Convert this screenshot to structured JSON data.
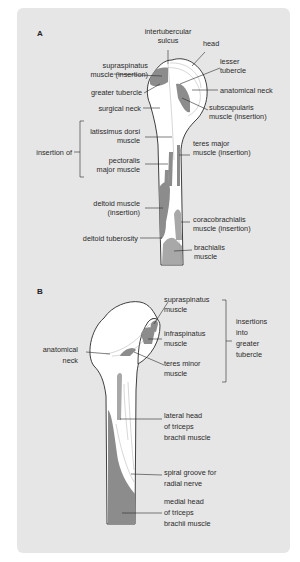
{
  "panels": {
    "A": {
      "label": "A",
      "labels": {
        "intertubercular_sulcus": [
          "intertubercular",
          "sulcus"
        ],
        "head": [
          "head"
        ],
        "supraspinatus_insertion": [
          "supraspinatus",
          "muscle (insertion)"
        ],
        "lesser_tubercle": [
          "lesser",
          "tubercle"
        ],
        "greater_tubercle": [
          "greater tubercle"
        ],
        "anatomical_neck": [
          "anatomical neck"
        ],
        "surgical_neck": [
          "surgical neck"
        ],
        "subscapularis_insertion": [
          "subscapularis",
          "muscle (insertion)"
        ],
        "latissimus_dorsi": [
          "latissimus dorsi",
          "muscle"
        ],
        "insertion_of": [
          "insertion of"
        ],
        "teres_major_insertion": [
          "teres major",
          "muscle (insertion)"
        ],
        "pectoralis_major": [
          "pectoralis",
          "major muscle"
        ],
        "deltoid_insertion": [
          "deltoid muscle",
          "(insertion)"
        ],
        "coracobrachialis_insertion": [
          "coracobrachialis",
          "muscle (insertion)"
        ],
        "deltoid_tuberosity": [
          "deltoid tuberosity"
        ],
        "brachialis": [
          "brachialis",
          "muscle"
        ]
      }
    },
    "B": {
      "label": "B",
      "labels": {
        "supraspinatus": [
          "supraspinatus",
          "muscle"
        ],
        "infraspinatus": [
          "infraspinatus",
          "muscle"
        ],
        "teres_minor": [
          "teres minor",
          "muscle"
        ],
        "insertions_into_greater_tubercle": [
          "insertions",
          "into",
          "greater",
          "tubercle"
        ],
        "anatomical_neck": [
          "anatomical",
          "neck"
        ],
        "lateral_head_triceps": [
          "lateral head",
          "of triceps",
          "brachii muscle"
        ],
        "spiral_groove": [
          "spiral groove for",
          "radial nerve"
        ],
        "medial_head_triceps": [
          "medial head",
          "of triceps",
          "brachii muscle"
        ]
      }
    }
  },
  "colors": {
    "card_background": "#e6e6e6",
    "bone": "#ffffff",
    "muscle_dark": "#8c8c8c",
    "muscle_light": "#a8a8a8",
    "text": "#2a2a2a"
  }
}
